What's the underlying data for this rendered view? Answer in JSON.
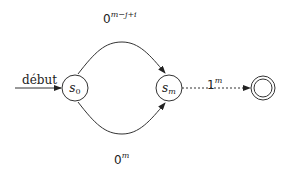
{
  "diagram": {
    "type": "finite-automaton",
    "start_label": "début",
    "states": [
      {
        "id": "s0",
        "name": "s",
        "sub": "0",
        "accepting": false
      },
      {
        "id": "sm",
        "name": "s",
        "sub": "m",
        "accepting": false
      },
      {
        "id": "final",
        "name": "",
        "sub": "",
        "accepting": true
      }
    ],
    "transitions": [
      {
        "from": "s0",
        "to": "sm",
        "label_base": "0",
        "label_exp": "m−j+i",
        "style": "solid",
        "curve": "top"
      },
      {
        "from": "s0",
        "to": "sm",
        "label_base": "0",
        "label_exp": "m",
        "style": "solid",
        "curve": "bottom"
      },
      {
        "from": "sm",
        "to": "final",
        "label_base": "1",
        "label_exp": "m",
        "style": "dotted"
      }
    ],
    "colors": {
      "stroke": "#333333",
      "text": "#222222",
      "background": "#ffffff"
    }
  }
}
